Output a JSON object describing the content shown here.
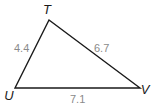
{
  "diagram": {
    "type": "triangle",
    "vertices": [
      {
        "id": "T",
        "label": "T",
        "x": 49,
        "y": 20,
        "label_x": 47,
        "label_y": 14
      },
      {
        "id": "U",
        "label": "U",
        "x": 15,
        "y": 88,
        "label_x": 9,
        "label_y": 100
      },
      {
        "id": "V",
        "label": "V",
        "x": 140,
        "y": 88,
        "label_x": 145,
        "label_y": 94
      }
    ],
    "sides": [
      {
        "id": "TU",
        "from": "T",
        "to": "U",
        "length_label": "4.4",
        "label_x": 14,
        "label_y": 52
      },
      {
        "id": "TV",
        "from": "T",
        "to": "V",
        "length_label": "6.7",
        "label_x": 94,
        "label_y": 52
      },
      {
        "id": "UV",
        "from": "U",
        "to": "V",
        "length_label": "7.1",
        "label_x": 70,
        "label_y": 103
      }
    ],
    "colors": {
      "line": "#1a1a1a",
      "vertex_label": "#1a1a1a",
      "side_label": "#8a8a8a",
      "background": "#ffffff"
    }
  }
}
